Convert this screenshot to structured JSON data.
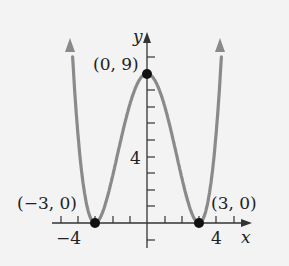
{
  "axes": {
    "x_label": "x",
    "y_label": "y",
    "x_tick_labels": [
      {
        "value": -4,
        "text": "−4"
      },
      {
        "value": 4,
        "text": "4"
      }
    ],
    "y_tick_labels": [
      {
        "value": 4,
        "text": "4"
      }
    ]
  },
  "points": [
    {
      "x": -3,
      "y": 0,
      "label": "(−3, 0)"
    },
    {
      "x": 0,
      "y": 9,
      "label": "(0, 9)"
    },
    {
      "x": 3,
      "y": 0,
      "label": "(3, 0)"
    }
  ],
  "colors": {
    "curve": "#8a8a8a",
    "axis": "#333333",
    "point": "#111111",
    "background": "#f3f3f3"
  }
}
